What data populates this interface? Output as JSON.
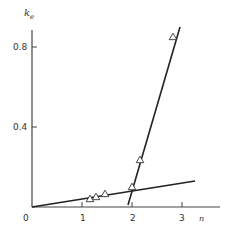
{
  "chart_data": {
    "type": "scatter",
    "title": "",
    "xlabel": "n",
    "ylabel": "k_e",
    "ylabel_main": "k",
    "ylabel_sub": "e",
    "xlim": [
      0,
      3.7
    ],
    "ylim": [
      0,
      0.9
    ],
    "grid": false,
    "legend": null,
    "x_ticks": [
      0,
      1,
      2,
      3
    ],
    "x_tick_labels": [
      "0",
      "1",
      "2",
      "3"
    ],
    "y_ticks": [
      0.4,
      0.8
    ],
    "y_tick_labels": [
      "0.4",
      "0.8"
    ],
    "series": [
      {
        "name": "data",
        "marker": "open-triangle",
        "x": [
          1.16,
          1.28,
          1.46,
          2.0,
          2.16,
          2.82
        ],
        "y": [
          0.04,
          0.05,
          0.065,
          0.1,
          0.235,
          0.85
        ]
      }
    ],
    "fit_lines": [
      {
        "name": "shallow-fit",
        "x": [
          0,
          3.26
        ],
        "y": [
          0,
          0.13
        ]
      },
      {
        "name": "steep-fit",
        "x": [
          1.92,
          2.96
        ],
        "y": [
          0.01,
          0.9
        ]
      }
    ]
  },
  "labels": {
    "origin": "0",
    "x1": "1",
    "x2": "2",
    "x3": "3",
    "xaxis": "n",
    "y04": "0.4",
    "y08": "0.8",
    "yaxis_main": "k",
    "yaxis_sub": "e"
  }
}
